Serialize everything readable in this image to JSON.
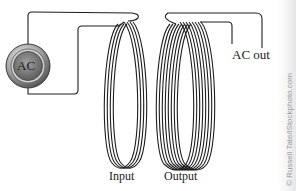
{
  "diagram": {
    "source": {
      "label": "AC",
      "icon": "ac-source-icon"
    },
    "coils": [
      {
        "id": "input",
        "label": "Input",
        "turns": 4
      },
      {
        "id": "output",
        "label": "Output",
        "turns": 8
      }
    ],
    "output_terminal": {
      "label": "AC out"
    },
    "watermark": "© Russell Tate/iStockphoto.com",
    "colors": {
      "wire": "#1e1e1e",
      "source_ring": "#8a8a8a",
      "source_face": "#6e6e6e",
      "background": "#ffffff"
    }
  }
}
